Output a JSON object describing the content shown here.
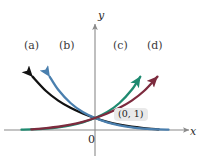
{
  "figure": {
    "background_color": "#ffffff",
    "width": 204,
    "height": 163
  },
  "axes": {
    "color": "#8a8a8a",
    "x_axis_label": "x",
    "y_axis_label": "y",
    "origin_label": "0"
  },
  "annotations": {
    "intersection_point_label": "(0, 1)",
    "intersection_badge_color": "#e9e9e9"
  },
  "curve_labels": {
    "a": "(a)",
    "b": "(b)",
    "c": "(c)",
    "d": "(d)"
  },
  "chart_data": {
    "type": "line",
    "title": "",
    "xlabel": "x",
    "ylabel": "y",
    "grid": false,
    "legend_position": "inline-curve-labels",
    "axis_origin_label": "0",
    "annotations": [
      {
        "text": "(0, 1)",
        "x": 0,
        "y": 1
      }
    ],
    "xlim": [
      -3.2,
      3.2
    ],
    "ylim": [
      -0.35,
      4.6
    ],
    "series": [
      {
        "name": "(a)",
        "color": "#111111",
        "shape": "exponential decay",
        "description": "decreasing exponential, arrow to upper-left, asymptotic to x-axis at right",
        "x": [
          -2.55,
          -2.0,
          -1.5,
          -1.0,
          -0.5,
          0.0,
          0.5,
          1.0,
          1.5,
          2.0,
          2.6
        ],
        "y": [
          4.45,
          3.25,
          2.45,
          1.85,
          1.38,
          1.0,
          0.68,
          0.44,
          0.27,
          0.16,
          0.06
        ]
      },
      {
        "name": "(b)",
        "color": "#4a7fae",
        "shape": "exponential decay",
        "description": "decreasing exponential, less steep than (a), arrow to upper-left",
        "x": [
          -1.85,
          -1.5,
          -1.0,
          -0.5,
          0.0,
          0.5,
          1.0,
          1.5,
          2.0,
          2.6,
          3.0
        ],
        "y": [
          4.45,
          3.35,
          2.25,
          1.5,
          1.0,
          0.63,
          0.38,
          0.22,
          0.12,
          0.05,
          0.03
        ]
      },
      {
        "name": "(c)",
        "color": "#1f8a70",
        "shape": "exponential growth",
        "description": "increasing exponential, arrow to upper-right, asymptotic to x-axis at left",
        "x": [
          -3.0,
          -2.6,
          -2.0,
          -1.5,
          -1.0,
          -0.5,
          0.0,
          0.5,
          1.0,
          1.5,
          1.85
        ],
        "y": [
          0.03,
          0.05,
          0.12,
          0.22,
          0.38,
          0.63,
          1.0,
          1.5,
          2.25,
          3.35,
          4.45
        ]
      },
      {
        "name": "(d)",
        "color": "#7d2b3e",
        "shape": "exponential growth",
        "description": "increasing exponential, less steep than (c), arrow to upper-right",
        "x": [
          -2.6,
          -2.0,
          -1.5,
          -1.0,
          -0.5,
          0.0,
          0.5,
          1.0,
          1.5,
          2.0,
          2.55
        ],
        "y": [
          0.06,
          0.16,
          0.27,
          0.44,
          0.68,
          1.0,
          1.38,
          1.85,
          2.45,
          3.25,
          4.45
        ]
      }
    ]
  }
}
